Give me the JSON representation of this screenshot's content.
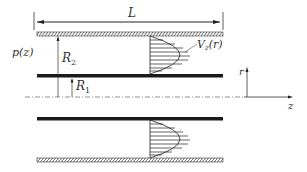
{
  "figure": {
    "type": "annular pipe flow schematic",
    "labels": {
      "length": "L",
      "pressure": "p(z)",
      "outer_radius": "R",
      "outer_radius_sub": "2",
      "inner_radius": "R",
      "inner_radius_sub": "1",
      "velocity": "V",
      "velocity_sub": "z",
      "velocity_arg": "(r)",
      "axis_r": "r",
      "axis_z": "z"
    },
    "colors": {
      "line": "#222222",
      "hatch": "#555555",
      "centerline": "#777777"
    }
  }
}
